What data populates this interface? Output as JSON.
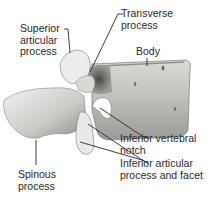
{
  "diagram": {
    "labels": {
      "superior_articular_process": "Superior\narticular\nprocess",
      "transverse_process": "Transverse\nprocess",
      "body": "Body",
      "inferior_vertebral_notch": "Inferior vertebral\nnotch",
      "inferior_articular_process": "Inferior articular\nprocess and facet",
      "spinous_process": "Spinous\nprocess"
    },
    "colors": {
      "text": "#2a2a2a",
      "leader_line": "#2a2a2a",
      "bone_light": "#e8e8e6",
      "bone_mid": "#b5b5b2",
      "bone_dark": "#5a5a58"
    }
  }
}
